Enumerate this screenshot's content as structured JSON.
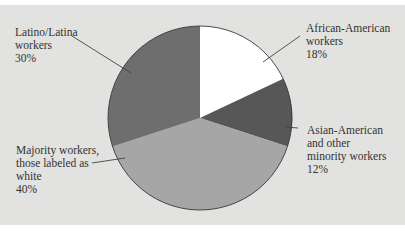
{
  "chart_data": {
    "type": "pie",
    "title": "",
    "categories": [
      "African-American workers",
      "Asian-American and other minority workers",
      "Majority workers, those labeled as white",
      "Latino/Latina workers"
    ],
    "values": [
      18,
      12,
      40,
      30
    ],
    "unit": "%",
    "colors": [
      "#ffffff",
      "#575757",
      "#a6a6a6",
      "#6e6e6e"
    ],
    "start_angle": "top",
    "direction": "clockwise",
    "legend": "none (direct labels with leader lines)"
  },
  "labels": {
    "african_american": {
      "line1": "African-American",
      "line2": "workers",
      "value": "18%"
    },
    "asian_american": {
      "line1": "Asian-American",
      "line2": "and other",
      "line3": "minority workers",
      "value": "12%"
    },
    "majority": {
      "line1": "Majority workers,",
      "line2": "those labeled as",
      "line3": "white",
      "value": "40%"
    },
    "latino": {
      "line1": "Latino/Latina",
      "line2": "workers",
      "value": "30%"
    }
  },
  "colors": {
    "background": "#e2e2e0",
    "outline": "#3a3a3a",
    "text": "#333333"
  }
}
